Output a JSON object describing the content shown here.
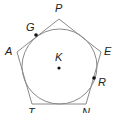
{
  "diagram": {
    "colors": {
      "stroke": "#8a8a8a",
      "point": "#111111",
      "label": "#222222"
    },
    "pentagon": {
      "vertices": [
        {
          "name": "P",
          "x": 59,
          "y": 19,
          "label_x": 55,
          "label_y": 12
        },
        {
          "name": "E",
          "x": 101,
          "y": 52,
          "label_x": 104,
          "label_y": 55
        },
        {
          "name": "N",
          "x": 86,
          "y": 104,
          "label_x": 82,
          "label_y": 116
        },
        {
          "name": "T",
          "x": 32,
          "y": 104,
          "label_x": 28,
          "label_y": 116
        },
        {
          "name": "A",
          "x": 17,
          "y": 52,
          "label_x": 5,
          "label_y": 55
        }
      ]
    },
    "circle": {
      "center": "K",
      "cx": 59.5,
      "cy": 66.5,
      "r": 37.5
    },
    "points": [
      {
        "name": "K",
        "x": 59,
        "y": 68,
        "label_x": 55,
        "label_y": 61
      },
      {
        "name": "G",
        "x": 36,
        "y": 35,
        "label_x": 26,
        "label_y": 31
      },
      {
        "name": "R",
        "x": 94,
        "y": 78,
        "label_x": 98,
        "label_y": 86
      }
    ]
  }
}
